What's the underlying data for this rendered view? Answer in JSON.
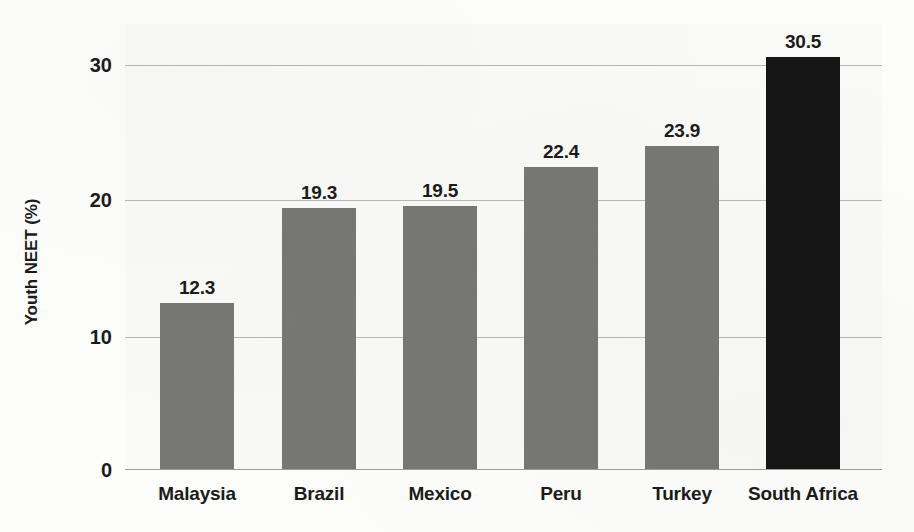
{
  "chart_data": {
    "type": "bar",
    "title": "",
    "subtitle": "",
    "xlabel": "",
    "ylabel": "Youth NEET (%)",
    "categories": [
      "Malaysia",
      "Brazil",
      "Mexico",
      "Peru",
      "Turkey",
      "South Africa"
    ],
    "values": [
      12.3,
      19.3,
      19.5,
      22.4,
      23.9,
      30.5
    ],
    "value_labels": [
      "12.3",
      "19.3",
      "19.5",
      "22.4",
      "23.9",
      "30.5"
    ],
    "ylim": [
      0,
      32.5
    ],
    "yticks": [
      0,
      10,
      20,
      30
    ],
    "ytick_labels": [
      "0",
      "10",
      "20",
      "30"
    ],
    "grid": true,
    "grid_axis": "y",
    "legend": false,
    "legend_position": "none",
    "bar_colors": [
      "#777775",
      "#777775",
      "#777775",
      "#777775",
      "#777775",
      "#161616"
    ],
    "highlight_category": "South Africa",
    "colors": {
      "bar_default": "#777775",
      "bar_highlight": "#161616",
      "gridline": "#b9b9b4",
      "axis": "#9d9d98",
      "text": "#1b1b1b",
      "plot_background": "#f9f9f7",
      "page_background": "#fdfdfc"
    }
  }
}
